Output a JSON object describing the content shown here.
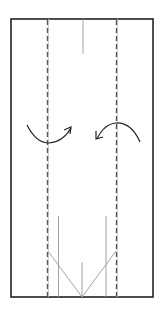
{
  "diagram": {
    "type": "origami-fold-step",
    "colors": {
      "background": "#ffffff",
      "outline": "#222222",
      "crease": "#999999",
      "dashed": "#555555",
      "arrow": "#222222"
    },
    "paper": {
      "x": 11,
      "y": 19,
      "width": 142,
      "height": 278
    },
    "fold_lines": [
      {
        "name": "left-valley-fold",
        "style": "dashed",
        "x": 47.5,
        "y1": 19,
        "y2": 297
      },
      {
        "name": "right-valley-fold",
        "style": "dashed",
        "x": 116.5,
        "y1": 19,
        "y2": 297
      }
    ],
    "creases": [
      {
        "name": "top-center-crease",
        "x1": 83,
        "y1": 19,
        "x2": 83,
        "y2": 54
      },
      {
        "name": "left-bottom-crease",
        "x1": 58.5,
        "y1": 216,
        "x2": 58.5,
        "y2": 297
      },
      {
        "name": "right-bottom-crease",
        "x1": 106,
        "y1": 216,
        "x2": 106,
        "y2": 297
      },
      {
        "name": "bottom-center-crease",
        "x1": 82,
        "y1": 262,
        "x2": 82,
        "y2": 297
      },
      {
        "name": "left-diagonal-crease",
        "x1": 48,
        "y1": 251,
        "x2": 82,
        "y2": 297
      },
      {
        "name": "right-diagonal-crease",
        "x1": 116,
        "y1": 251,
        "x2": 82,
        "y2": 297
      }
    ],
    "arrows": [
      {
        "name": "left-fold-arrow",
        "direction": "fold-right"
      },
      {
        "name": "right-fold-arrow",
        "direction": "fold-left"
      }
    ]
  }
}
